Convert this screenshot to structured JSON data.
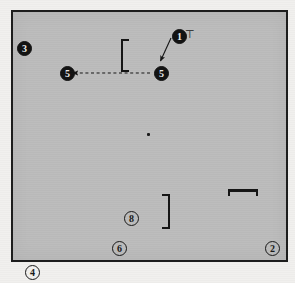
{
  "figure": {
    "kind": "technical-line-drawing",
    "background_color": "#f1f0ee",
    "plate_fill_color": "#bcbcbc",
    "ink_color": "#141414",
    "plate": {
      "x": 11,
      "y": 10,
      "width": 277,
      "height": 252
    }
  },
  "reference_numerals": [
    {
      "id": "ref-1",
      "label": "1",
      "style": "filled",
      "x": 172,
      "y": 29
    },
    {
      "id": "ref-3",
      "label": "3",
      "style": "filled",
      "x": 17,
      "y": 41
    },
    {
      "id": "ref-5a",
      "label": "5",
      "style": "filled",
      "x": 60,
      "y": 68
    },
    {
      "id": "ref-5b",
      "label": "5",
      "style": "filled",
      "x": 154,
      "y": 68
    },
    {
      "id": "ref-8",
      "label": "8",
      "style": "outline",
      "x": 124,
      "y": 211
    },
    {
      "id": "ref-6",
      "label": "6",
      "style": "outline",
      "x": 112,
      "y": 241
    },
    {
      "id": "ref-2",
      "label": "2",
      "style": "outline",
      "x": 265,
      "y": 241
    },
    {
      "id": "ref-4",
      "label": "4",
      "style": "outline",
      "x": 25,
      "y": 264
    }
  ],
  "marks": {
    "tee_mark": "⊤",
    "tee_x": 185,
    "tee_y": 30,
    "center_dot_x": 147,
    "center_dot_y": 133
  },
  "brackets": [
    {
      "id": "bracket-upper-left",
      "orientation": "left",
      "x": 121,
      "y": 39,
      "width": 8,
      "height": 33
    },
    {
      "id": "bracket-lower-right",
      "orientation": "right",
      "x": 162,
      "y": 194,
      "width": 8,
      "height": 35
    }
  ],
  "scale_bar": {
    "id": "scale-bar",
    "x": 228,
    "y": 189,
    "width": 30,
    "height": 7
  },
  "connectors": [
    {
      "id": "leader-1-to-5",
      "kind": "solid-leader-arrow",
      "from": [
        171,
        38
      ],
      "to": [
        160,
        62
      ],
      "arrowhead": "at-end"
    },
    {
      "id": "dimension-5-to-5",
      "kind": "dashed-double-arrow",
      "from": [
        150,
        73
      ],
      "to": [
        72,
        73
      ],
      "arrowhead": "at-end"
    }
  ]
}
